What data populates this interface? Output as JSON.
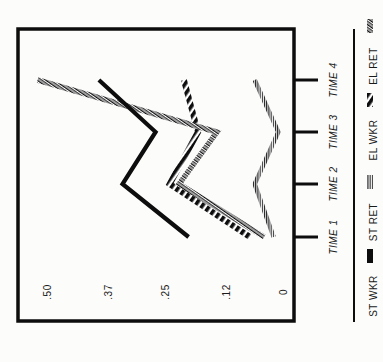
{
  "chart_data": {
    "type": "line",
    "title": "",
    "xlabel": "",
    "ylabel": "",
    "orientation": "rotated-90-ccw",
    "categories": [
      "TIME 1",
      "TIME 2",
      "TIME 3",
      "TIME 4"
    ],
    "y_ticks": [
      "0",
      ".12",
      ".25",
      ".37",
      ".50"
    ],
    "ylim": [
      0,
      0.5
    ],
    "grid": false,
    "legend_position": "bottom (right side when rotated)",
    "series": [
      {
        "name": "ST WKR",
        "style": "solid-black",
        "values": [
          0.2,
          0.34,
          0.27,
          0.39
        ]
      },
      {
        "name": "ST RET",
        "style": "comb-hatch",
        "values": [
          0.02,
          0.06,
          0.01,
          0.06
        ]
      },
      {
        "name": "EL WKR",
        "style": "bold-diagonal-hatch",
        "values": [
          0.07,
          0.24,
          0.18,
          0.21
        ]
      },
      {
        "name": "EL RET",
        "style": "double-stripe-hatch",
        "values": [
          0.04,
          0.22,
          0.14,
          0.52
        ]
      }
    ]
  },
  "axis": {
    "ticks": [
      {
        "label": "0",
        "value": 0
      },
      {
        "label": ".12",
        "value": 0.12
      },
      {
        "label": ".25",
        "value": 0.25
      },
      {
        "label": ".37",
        "value": 0.37
      },
      {
        "label": ".50",
        "value": 0.5
      }
    ],
    "times": [
      "TIME 1",
      "TIME 2",
      "TIME 3",
      "TIME 4"
    ]
  },
  "legend": {
    "items": [
      "ST WKR",
      "ST RET",
      "EL WKR",
      "EL RET"
    ]
  },
  "colors": {
    "ink": "#0d0d0d",
    "paper": "#fcfcfb"
  }
}
